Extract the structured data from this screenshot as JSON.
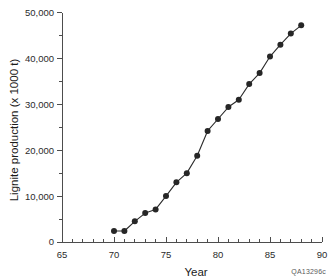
{
  "chart_data": {
    "type": "line",
    "title": "",
    "xlabel": "Year",
    "ylabel": "Lignite production (x 1000 t)",
    "xlim": [
      65,
      90
    ],
    "ylim": [
      0,
      50000
    ],
    "x_ticks": [
      65,
      70,
      75,
      80,
      85,
      90
    ],
    "x_tick_labels": [
      "65",
      "70",
      "75",
      "80",
      "85",
      "90"
    ],
    "x_minor_interval": 1,
    "y_ticks": [
      0,
      10000,
      20000,
      30000,
      40000,
      50000
    ],
    "y_tick_labels": [
      "0",
      "10,000",
      "20,000",
      "30,000",
      "40,000",
      "50,000"
    ],
    "y_minor_interval": 5000,
    "grid": false,
    "legend": false,
    "marker": "filled-circle",
    "series": [
      {
        "name": "Lignite production",
        "x": [
          70,
          71,
          72,
          73,
          74,
          75,
          76,
          77,
          78,
          79,
          80,
          81,
          82,
          83,
          84,
          85,
          86,
          87,
          88
        ],
        "y": [
          2400,
          2400,
          4500,
          6300,
          7100,
          10000,
          13000,
          15000,
          18800,
          24200,
          26800,
          29400,
          31000,
          34400,
          36800,
          40400,
          43000,
          45400,
          47200
        ]
      }
    ],
    "annotations": [
      {
        "name": "source-code",
        "text": "QA13296c"
      }
    ]
  },
  "axis": {
    "x_title": "Year",
    "y_title": "Lignite production (x 1000 t)"
  },
  "footer": {
    "code": "QA13296c"
  },
  "colors": {
    "line": "#2b2b2b",
    "marker": "#262626",
    "axis": "#4d4d4d",
    "text": "#1a1a1a",
    "background": "#ffffff"
  }
}
